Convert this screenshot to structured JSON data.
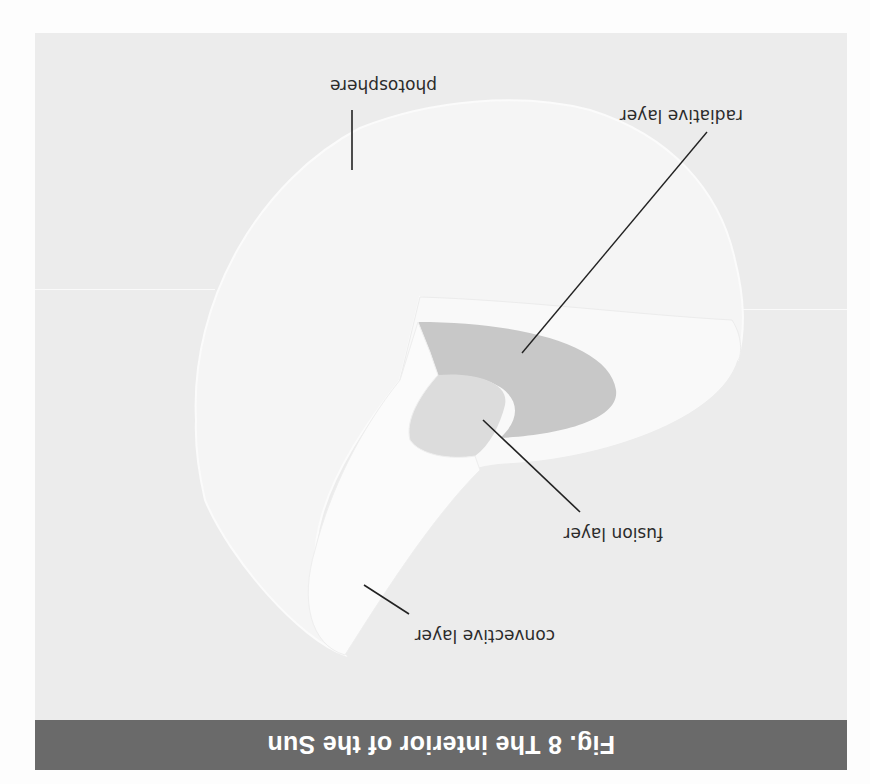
{
  "figure": {
    "orientation": "rotated 180°",
    "caption": "Fig. 8  The interior of the Sun",
    "labels": {
      "photosphere": "photosphere",
      "radiative": "radiative layer",
      "fusion": "fusion layer",
      "convective": "convective layer"
    },
    "colors": {
      "panel": "#ececec",
      "caption_bar": "#6a6a6a",
      "caption_text": "#ffffff",
      "sphere": "#f4f4f4",
      "cut_face": "#f8f8f8",
      "radiative_zone": "#c9c9c9",
      "core": "#dcdcdc",
      "leader_lines": "#222222"
    }
  }
}
